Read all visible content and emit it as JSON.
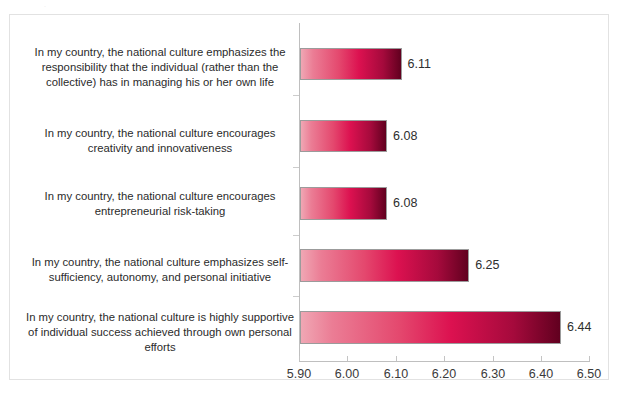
{
  "artifact": {
    "top_text": "."
  },
  "chart_data": {
    "type": "bar",
    "orientation": "horizontal",
    "title": "",
    "subtitle": "",
    "xlabel": "",
    "ylabel": "",
    "xlim": [
      5.9,
      6.5
    ],
    "xticks": [
      "5.90",
      "6.00",
      "6.10",
      "6.20",
      "6.30",
      "6.40",
      "6.50"
    ],
    "xtick_values": [
      5.9,
      6.0,
      6.1,
      6.2,
      6.3,
      6.4,
      6.5
    ],
    "grid": false,
    "legend": null,
    "legend_position": "none",
    "bar_gradient": {
      "start": "#f0a7b4",
      "mid": "#dc1150",
      "end": "#61001f",
      "border": "#9b9b9b"
    },
    "categories": [
      "In my country, the national culture emphasizes the responsibility that the individual (rather than the collective) has in managing his or her own life",
      "In my country, the national culture encourages creativity and innovativeness",
      "In my country, the national culture encourages entrepreneurial risk-taking",
      "In my country, the national culture emphasizes self-sufficiency, autonomy, and personal initiative",
      "In my country, the national culture is highly supportive of individual success achieved through own personal efforts"
    ],
    "values": [
      6.11,
      6.08,
      6.08,
      6.25,
      6.44
    ],
    "value_labels": [
      "6.11",
      "6.08",
      "6.08",
      "6.25",
      "6.44"
    ]
  }
}
